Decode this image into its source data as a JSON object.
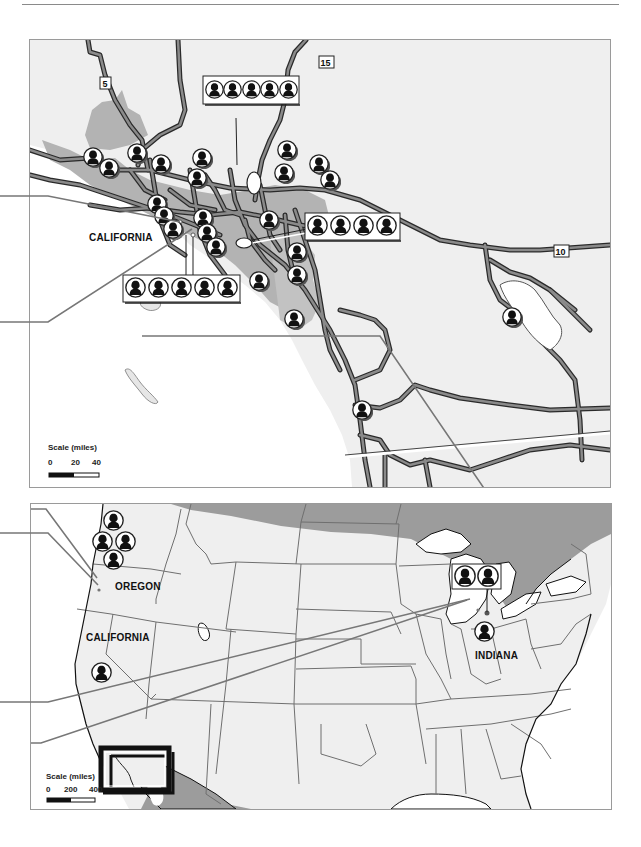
{
  "figure": {
    "top_map": {
      "region_label": "CALIFORNIA",
      "highway_shields": [
        "5",
        "15",
        "10"
      ],
      "scale": {
        "title": "Scale (miles)",
        "ticks": [
          "0",
          "20",
          "40"
        ]
      },
      "callout_groups": [
        {
          "id": "north-cluster",
          "count": 5
        },
        {
          "id": "central-cluster",
          "count": 5
        },
        {
          "id": "east-cluster",
          "count": 4
        }
      ],
      "individual_markers": 22
    },
    "bottom_map": {
      "region_labels": [
        "OREGON",
        "CALIFORNIA",
        "INDIANA"
      ],
      "scale": {
        "title": "Scale (miles)",
        "ticks": [
          "0",
          "200",
          "400"
        ]
      },
      "callout_groups": [
        {
          "id": "indiana-cluster",
          "count": 2
        }
      ],
      "individual_markers": 6
    },
    "colors": {
      "land": "#efefef",
      "urban": "#b3b3b3",
      "water": "#ffffff",
      "canada_mexico": "#9c9c9c",
      "road_fill": "#8a8a8a",
      "road_edge": "#2a2a2a",
      "border": "#6f6f6f"
    }
  }
}
